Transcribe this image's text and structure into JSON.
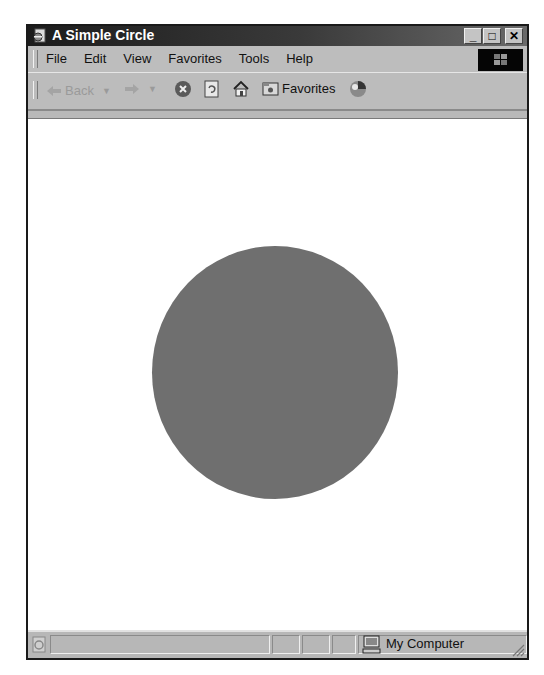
{
  "window": {
    "title": "A Simple Circle",
    "controls": {
      "minimize": "_",
      "maximize": "□",
      "close": "✕"
    }
  },
  "menu": {
    "items": [
      {
        "label": "File"
      },
      {
        "label": "Edit"
      },
      {
        "label": "View"
      },
      {
        "label": "Favorites"
      },
      {
        "label": "Tools"
      },
      {
        "label": "Help"
      }
    ]
  },
  "toolbar": {
    "back_label": "Back",
    "favorites_label": "Favorites",
    "icons": [
      "back-arrow-icon",
      "forward-arrow-icon",
      "stop-icon",
      "refresh-icon",
      "home-icon",
      "favorites-icon",
      "media-icon"
    ]
  },
  "content": {
    "circle": {
      "fill": "#6f6f6f",
      "shape": "circle"
    }
  },
  "statusbar": {
    "zone_label": "My Computer"
  },
  "colors": {
    "titlebar": "#1c1c1c",
    "chrome": "#bdbdbd",
    "page_background": "#ffffff"
  }
}
